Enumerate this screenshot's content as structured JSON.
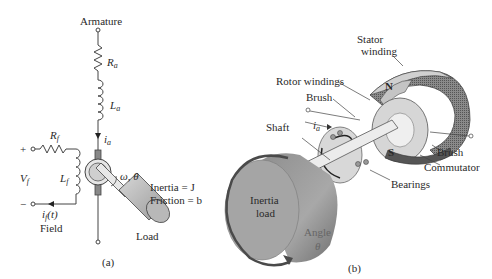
{
  "panel_a": {
    "caption": "(a)",
    "armature_label": "Armature",
    "Ra": {
      "main": "R",
      "sub": "a"
    },
    "La": {
      "main": "L",
      "sub": "a"
    },
    "ia": {
      "main": "i",
      "sub": "a"
    },
    "Rf": {
      "main": "R",
      "sub": "f"
    },
    "Lf": {
      "main": "L",
      "sub": "f"
    },
    "Vf": {
      "main": "V",
      "sub": "f"
    },
    "plus": "+",
    "minus": "−",
    "if_label": {
      "main": "i",
      "sub": "f",
      "rest": "(t)"
    },
    "field_label": "Field",
    "omega_theta": "ω, θ",
    "inertia": "Inertia = J",
    "friction": "Friction = b",
    "load": "Load"
  },
  "panel_b": {
    "caption": "(b)",
    "stator_winding": [
      "Stator",
      "winding"
    ],
    "rotor_windings": "Rotor windings",
    "brush_top": "Brush",
    "shaft": "Shaft",
    "ia": {
      "main": "i",
      "sub": "a"
    },
    "N": "N",
    "S": "S",
    "brush_bottom": "Brush",
    "commutator": "Commutator",
    "bearings": "Bearings",
    "inertia_load": [
      "Inertia",
      "load"
    ],
    "angle": "Angle",
    "theta": "θ"
  },
  "colors": {
    "line": "#444444",
    "load_gray": "#9a9a9a",
    "load_face": "#b5b5b5",
    "arrow_dark": "#555555"
  }
}
